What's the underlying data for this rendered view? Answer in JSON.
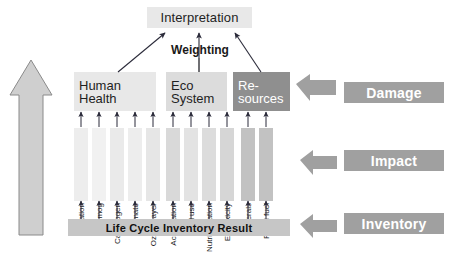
{
  "diagram": {
    "title_box": {
      "label": "Interpretation"
    },
    "weighting": {
      "label": "Weighting"
    },
    "environmental_mechanism": {
      "label": "Environmental mechanism"
    },
    "inventory_bar": {
      "label": "Life Cycle Inventory Result"
    },
    "damage_categories": [
      {
        "id": "human-health",
        "line1": "Human",
        "line2": "Health",
        "color": "#e8e8e8",
        "text_color": "#1f1f1f"
      },
      {
        "id": "eco-system",
        "line1": "Eco",
        "line2": "System",
        "color": "#dcdcdc",
        "text_color": "#1f1f1f"
      },
      {
        "id": "resources",
        "line1": "Re-",
        "line2": "sources",
        "color": "#8f8f8f",
        "text_color": "#ffffff"
      }
    ],
    "impact_categories": [
      {
        "label": "Radiation",
        "group": "human-health",
        "x": 74,
        "color": "#ededed"
      },
      {
        "label": "Smog",
        "group": "human-health",
        "x": 92,
        "color": "#f1f1f1"
      },
      {
        "label": "Carcinogen",
        "group": "human-health",
        "x": 110,
        "color": "#eaeaea"
      },
      {
        "label": "Climate",
        "group": "human-health",
        "x": 128,
        "color": "#ededed"
      },
      {
        "label": "Ozone layer",
        "group": "human-health",
        "x": 146,
        "color": "#e6e6e6"
      },
      {
        "label": "Acidification",
        "group": "eco-system",
        "x": 166,
        "color": "#d9d9d9"
      },
      {
        "label": "Land use",
        "group": "eco-system",
        "x": 184,
        "color": "#e3e3e3"
      },
      {
        "label": "Nutriphication",
        "group": "eco-system",
        "x": 202,
        "color": "#dcdcdc"
      },
      {
        "label": "Ecotoxicity",
        "group": "eco-system",
        "x": 220,
        "color": "#d6d6d6"
      },
      {
        "label": "Minerals",
        "group": "resources",
        "x": 241,
        "color": "#c2c2c2"
      },
      {
        "label": "Fossil fuel",
        "group": "resources",
        "x": 259,
        "color": "#c2c2c2"
      }
    ],
    "tiers": [
      {
        "id": "damage",
        "label": "Damage"
      },
      {
        "id": "impact",
        "label": "Impact"
      },
      {
        "id": "inventory",
        "label": "Inventory"
      }
    ],
    "colors": {
      "tier_bar": "#a0a0a0",
      "tier_text": "#ffffff",
      "inventory_bar": "#c6c6c6",
      "interpretation_bg": "#e8e8e8",
      "arrow": "#2b2b3a",
      "outline": "#6b6b6b",
      "env_arrow_fill": "#cfcfcf"
    }
  }
}
